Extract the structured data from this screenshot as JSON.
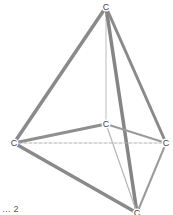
{
  "diagram": {
    "type": "molecule-3d",
    "atoms": [
      {
        "id": "top",
        "element": "C",
        "x": 106,
        "y": 7
      },
      {
        "id": "mid",
        "element": "C",
        "x": 106,
        "y": 124
      },
      {
        "id": "left",
        "element": "C",
        "x": 14,
        "y": 143
      },
      {
        "id": "right",
        "element": "C",
        "x": 166,
        "y": 143
      },
      {
        "id": "bottom",
        "element": "C",
        "x": 137,
        "y": 213
      }
    ],
    "bonds": [
      {
        "from": "top",
        "to": "left",
        "width": 3.5,
        "color": "#8a8a8a",
        "dash": ""
      },
      {
        "from": "top",
        "to": "mid",
        "width": 1.2,
        "color": "#c8c8c8",
        "dash": ""
      },
      {
        "from": "top",
        "to": "right",
        "width": 3,
        "color": "#8a8a8a",
        "dash": ""
      },
      {
        "from": "top",
        "to": "bottom",
        "width": 3.5,
        "color": "#858585",
        "dash": ""
      },
      {
        "from": "left",
        "to": "mid",
        "width": 3,
        "color": "#8f8f8f",
        "dash": ""
      },
      {
        "from": "mid",
        "to": "right",
        "width": 2,
        "color": "#9a9a9a",
        "dash": ""
      },
      {
        "from": "left",
        "to": "right",
        "width": 1,
        "color": "#b0b0b0",
        "dash": "3,2"
      },
      {
        "from": "left",
        "to": "bottom",
        "width": 3.5,
        "color": "#8a8a8a",
        "dash": ""
      },
      {
        "from": "mid",
        "to": "bottom",
        "width": 1.2,
        "color": "#b5b5b5",
        "dash": ""
      },
      {
        "from": "right",
        "to": "bottom",
        "width": 2,
        "color": "#9a9a9a",
        "dash": ""
      }
    ],
    "caption": "… 2"
  }
}
